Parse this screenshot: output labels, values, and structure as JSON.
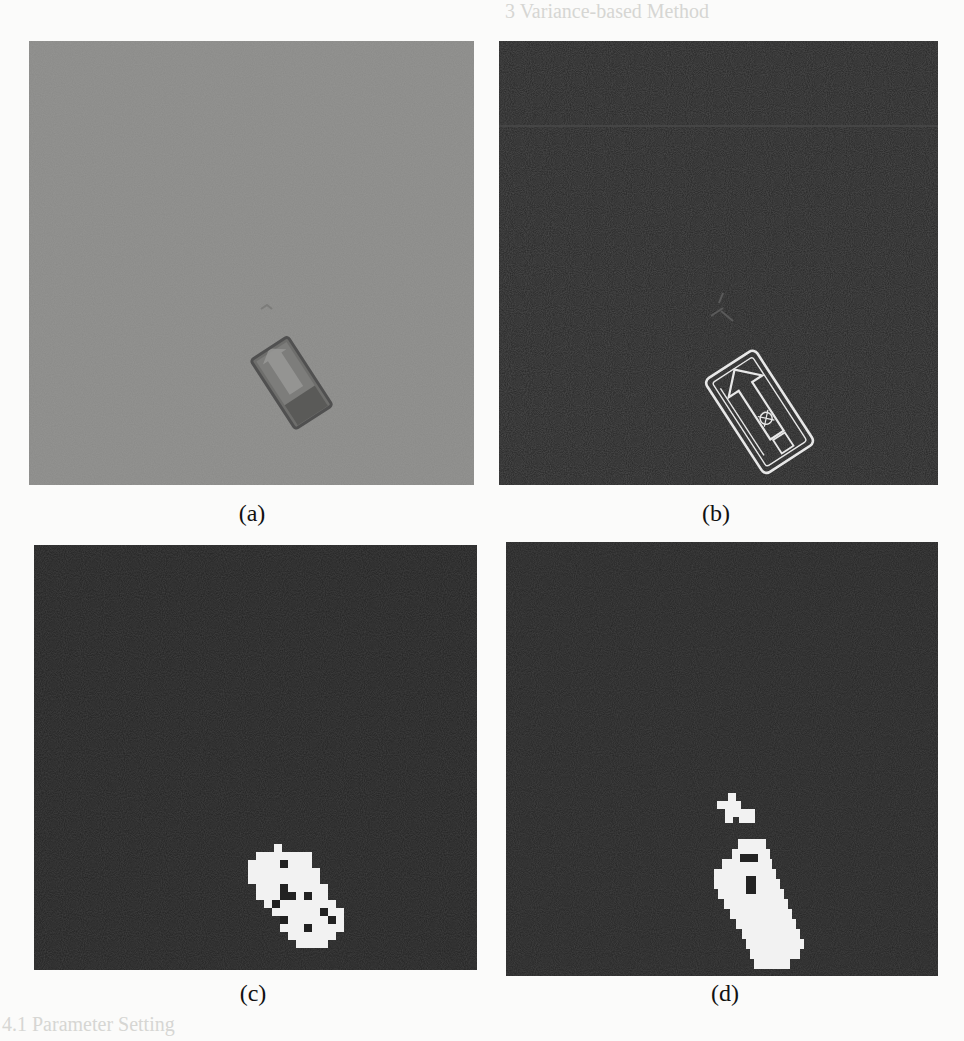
{
  "figure": {
    "background_text": {
      "heading_fragment": "3   Variance-based Method",
      "subheading_fragment": "4.1   Parameter Setting"
    },
    "panels": [
      {
        "id": "a",
        "caption": "(a)",
        "description": "original grayscale aerial image with small rectangular object",
        "background": "#8a8a88"
      },
      {
        "id": "b",
        "caption": "(b)",
        "description": "edge / variance map showing bright outline of object with arrow marking",
        "background": "#262626"
      },
      {
        "id": "c",
        "caption": "(c)",
        "description": "binary segmentation mask of object (blocky white blob with holes)",
        "background": "#222222"
      },
      {
        "id": "d",
        "caption": "(d)",
        "description": "binary segmentation mask with object and small cross-shaped blob above",
        "background": "#242424"
      }
    ]
  }
}
